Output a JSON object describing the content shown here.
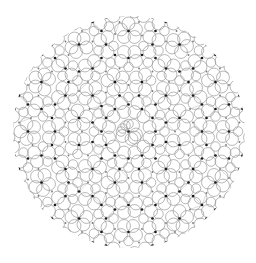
{
  "image": {
    "width": 256,
    "height": 263,
    "background": "#ffffff",
    "description": "Circular disc filled with a quasicrystalline pattern of small ring motifs and dark vertex dots"
  },
  "pattern": {
    "center": [
      129,
      132
    ],
    "radius": 116,
    "symmetry": 12,
    "spacing": 12.5,
    "ring_radius": 5.6,
    "ring_stroke": "#9a9a9a",
    "ring_stroke_width": 0.7,
    "dot_color": "#1a1a1a",
    "dot_radius": 1.35,
    "light_dot_color": "#7a7a7a",
    "light_dot_radius": 0.9,
    "edge_line_color": "#b5b5b5",
    "edge_line_width": 0.5
  }
}
